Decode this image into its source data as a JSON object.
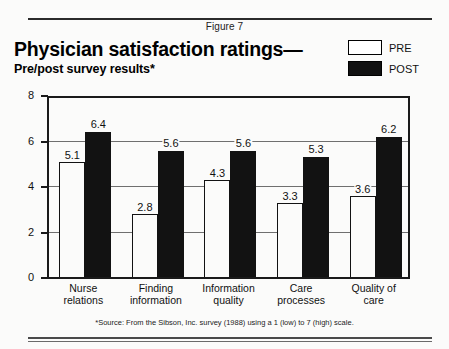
{
  "figure": {
    "number_label": "Figure 7",
    "title": "Physician satisfaction ratings—",
    "subtitle": "Pre/post survey results*",
    "footnote": "*Source: From the Sibson, Inc. survey (1988) using a 1 (low) to 7 (high) scale."
  },
  "legend": {
    "position": "top-right",
    "entries": [
      {
        "label": "PRE",
        "swatch": "white-outlined-square",
        "color": "#ffffff"
      },
      {
        "label": "POST",
        "swatch": "solid-black-square",
        "color": "#111111"
      }
    ]
  },
  "chart_data": {
    "type": "bar",
    "title": "Physician satisfaction ratings—",
    "subtitle": "Pre/post survey results*",
    "xlabel": "",
    "ylabel": "",
    "ylim": [
      0,
      8
    ],
    "yticks": [
      0,
      2,
      4,
      6,
      8
    ],
    "ytick_labels": [
      "0",
      "2",
      "4",
      "6",
      "8"
    ],
    "grid": true,
    "gridlines_at": [
      2,
      4,
      6
    ],
    "legend_position": "top-right",
    "categories": [
      "Nurse relations",
      "Finding information",
      "Information quality",
      "Care processes",
      "Quality of care"
    ],
    "category_lines": [
      [
        "Nurse",
        "relations"
      ],
      [
        "Finding",
        "information"
      ],
      [
        "Information",
        "quality"
      ],
      [
        "Care",
        "processes"
      ],
      [
        "Quality of",
        "care"
      ]
    ],
    "series": [
      {
        "name": "PRE",
        "color": "#ffffff",
        "values": [
          5.1,
          2.8,
          4.3,
          3.3,
          3.6
        ]
      },
      {
        "name": "POST",
        "color": "#111111",
        "values": [
          6.4,
          5.6,
          5.6,
          5.3,
          6.2
        ]
      }
    ],
    "value_labels": [
      "5.1",
      "6.4",
      "2.8",
      "5.6",
      "4.3",
      "5.6",
      "3.3",
      "5.3",
      "3.6",
      "6.2"
    ],
    "note": "*Source: From the Sibson, Inc. survey (1988) using a 1 (low) to 7 (high) scale."
  }
}
